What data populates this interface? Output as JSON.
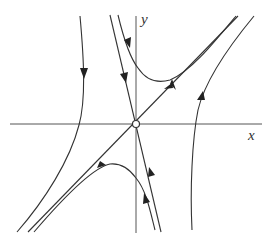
{
  "diagram": {
    "type": "phase-portrait",
    "axes": {
      "x_label": "x",
      "y_label": "y"
    },
    "equilibrium": {
      "kind": "saddle",
      "marker": "open-circle"
    },
    "colors": {
      "line": "#333333",
      "axis": "#555555",
      "background": "#ffffff"
    }
  }
}
